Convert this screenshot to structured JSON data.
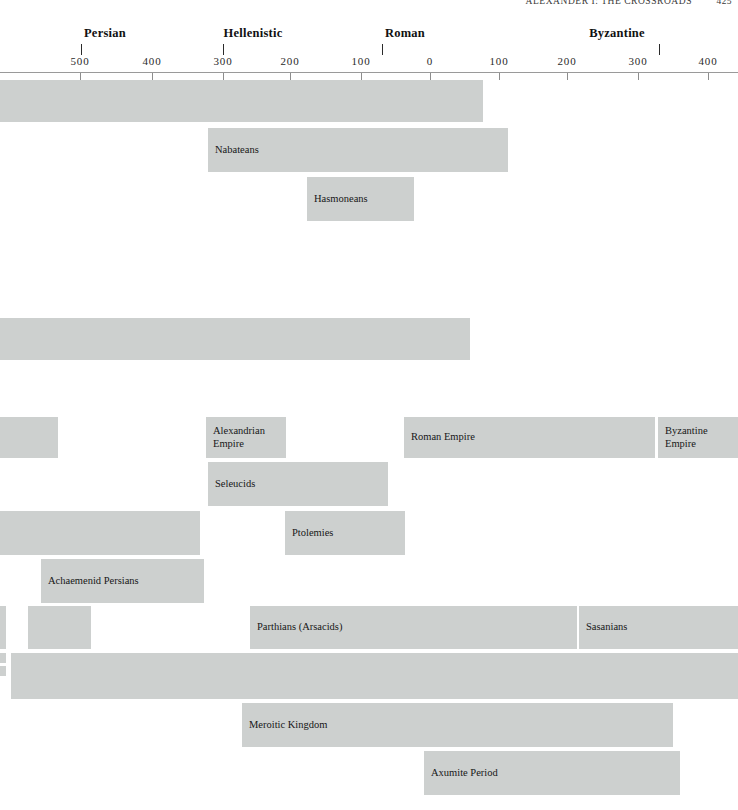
{
  "running_head": {
    "title": "Alexander I: The Crossroads",
    "folio": "425"
  },
  "chart_data": {
    "type": "bar",
    "orientation": "horizontal",
    "xlabel": "",
    "ylabel": "",
    "grid": false,
    "legend_position": "none",
    "axis": {
      "tick_labels": [
        "500",
        "400",
        "300",
        "200",
        "100",
        "0",
        "100",
        "200",
        "300",
        "400"
      ],
      "tick_values": [
        -500,
        -400,
        -300,
        -200,
        -100,
        0,
        100,
        200,
        300,
        400
      ],
      "tick_x": [
        80,
        152,
        223,
        290,
        361,
        430,
        499,
        567,
        638,
        708
      ],
      "xlim": [
        -557,
        440
      ],
      "axis_y": 72
    },
    "eras": [
      {
        "label": "Persian",
        "tick_x": 81,
        "label_x": 105
      },
      {
        "label": "Hellenistic",
        "tick_x": 223,
        "label_x": 253
      },
      {
        "label": "Roman",
        "tick_x": 382,
        "label_x": 405
      },
      {
        "label": "Byzantine",
        "tick_x": 659,
        "label_x": 617
      }
    ],
    "bars": [
      {
        "label": "",
        "x": 0,
        "y": 80,
        "w": 483,
        "h": 42
      },
      {
        "label": "Nabateans",
        "x": 208,
        "y": 128,
        "w": 300,
        "h": 44
      },
      {
        "label": "Hasmoneans",
        "x": 307,
        "y": 177,
        "w": 107,
        "h": 44
      },
      {
        "label": "",
        "x": 0,
        "y": 318,
        "w": 470,
        "h": 42
      },
      {
        "label": "",
        "x": 0,
        "y": 417,
        "w": 58,
        "h": 41
      },
      {
        "label": "Alexandrian\nEmpire",
        "x": 206,
        "y": 417,
        "w": 80,
        "h": 41
      },
      {
        "label": "Roman Empire",
        "x": 404,
        "y": 417,
        "w": 251,
        "h": 41
      },
      {
        "label": "Byzantine\nEmpire",
        "x": 658,
        "y": 417,
        "w": 80,
        "h": 41
      },
      {
        "label": "Seleucids",
        "x": 208,
        "y": 462,
        "w": 180,
        "h": 44
      },
      {
        "label": "",
        "x": 0,
        "y": 511,
        "w": 200,
        "h": 44
      },
      {
        "label": "Ptolemies",
        "x": 285,
        "y": 511,
        "w": 120,
        "h": 44
      },
      {
        "label": "Achaemenid Persians",
        "x": 41,
        "y": 559,
        "w": 163,
        "h": 44
      },
      {
        "label": "",
        "x": 0,
        "y": 606,
        "w": 6,
        "h": 43
      },
      {
        "label": "",
        "x": 28,
        "y": 606,
        "w": 63,
        "h": 43
      },
      {
        "label": "Parthians (Arsacids)",
        "x": 250,
        "y": 606,
        "w": 327,
        "h": 43
      },
      {
        "label": "Sasanians",
        "x": 579,
        "y": 606,
        "w": 159,
        "h": 43
      },
      {
        "label": "",
        "x": 0,
        "y": 653,
        "w": 6,
        "h": 10
      },
      {
        "label": "",
        "x": 0,
        "y": 666,
        "w": 6,
        "h": 10
      },
      {
        "label": "",
        "x": 11,
        "y": 653,
        "w": 727,
        "h": 46
      },
      {
        "label": "Meroitic Kingdom",
        "x": 242,
        "y": 703,
        "w": 431,
        "h": 44
      },
      {
        "label": "Axumite Period",
        "x": 424,
        "y": 751,
        "w": 256,
        "h": 44
      }
    ]
  }
}
